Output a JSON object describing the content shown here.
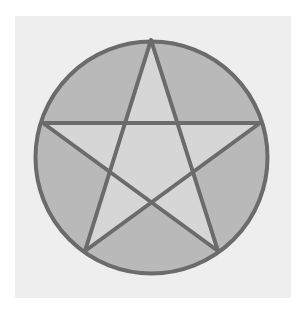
{
  "figure": {
    "type": "pentagram-in-circle",
    "shapes": [
      "circle",
      "five-pointed-star"
    ],
    "colors": {
      "background": "#ffffff",
      "panel": "#eeeeee",
      "outer_segments": "#b9b9b9",
      "star_interior": "#d6d6d6",
      "outline": "#6b6b6b"
    }
  }
}
